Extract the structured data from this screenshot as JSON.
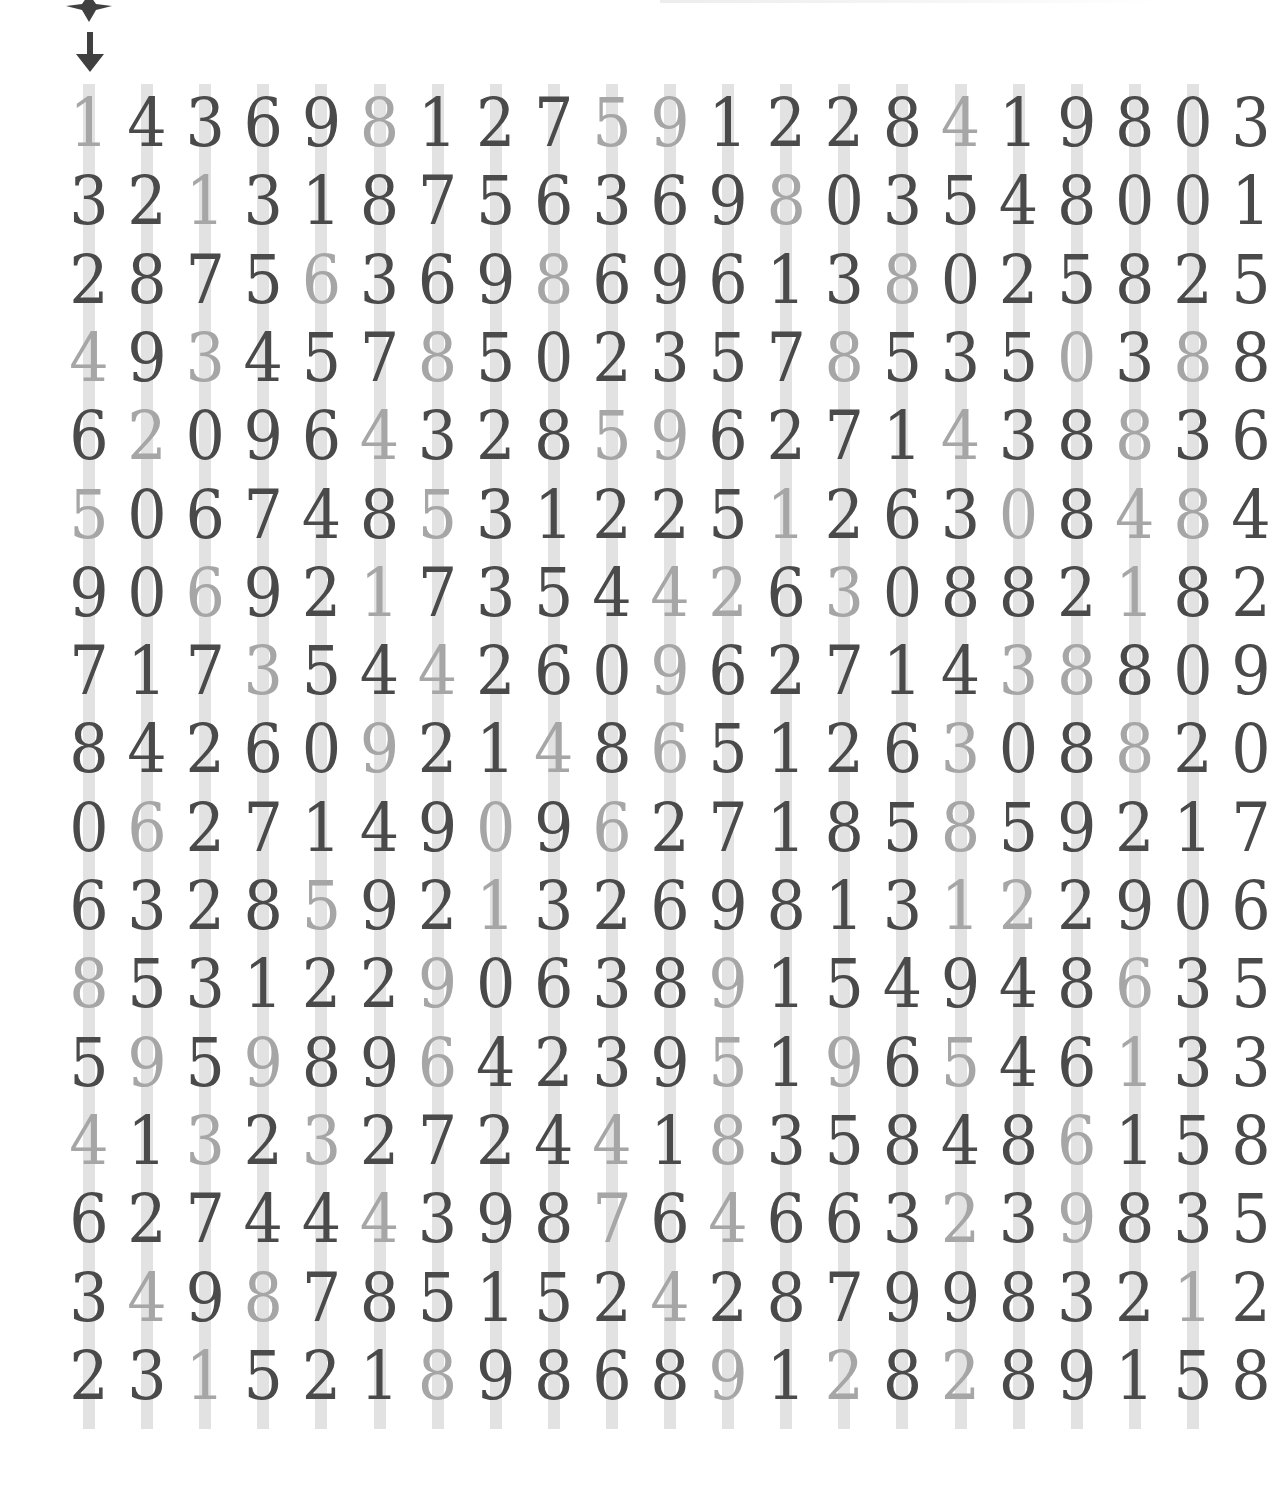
{
  "puzzle": {
    "type": "digit-grid",
    "columns": 20,
    "rows_count": 17,
    "colors": {
      "dark": "#4a4a4a",
      "light": "#a6a6a6",
      "column_bar": "#e2e2e2",
      "icon": "#404040"
    },
    "markers": {
      "top_icon": "star-shape-icon",
      "arrow": "down-arrow-icon"
    },
    "rows": [
      "14369812759122841980 3",
      "32131875636980354800 1",
      "28756369869613802582 5",
      "49345785023578535038 8",
      "62096432859627143883 6",
      "50674853122512630848 4",
      "90692173544263088218 2",
      "71735442609627143880 9",
      "84260921486512630882 0",
      "06271490962718585921 7",
      "63285921326981312290 6",
      "85312290638915494863 5",
      "59598964239519654613 3",
      "41323272441835848615 8",
      "62744439876466323983 5",
      "34987851524287998321 2",
      "23152189868912828915 8"
    ],
    "light_mask": [
      [
        0,
        5,
        9,
        10,
        15
      ],
      [
        2,
        12
      ],
      [
        4,
        8,
        14
      ],
      [
        0,
        2,
        6,
        13,
        17,
        19
      ],
      [
        1,
        5,
        9,
        10,
        15,
        18
      ],
      [
        0,
        6,
        12,
        16,
        18,
        19
      ],
      [
        2,
        5,
        10,
        11,
        13,
        18
      ],
      [
        3,
        6,
        10,
        16,
        17
      ],
      [
        5,
        8,
        10,
        15,
        18
      ],
      [
        1,
        7,
        9,
        15
      ],
      [
        4,
        7,
        15,
        16
      ],
      [
        0,
        6,
        11,
        18
      ],
      [
        1,
        3,
        6,
        11,
        13,
        15,
        18
      ],
      [
        0,
        2,
        4,
        9,
        11,
        17
      ],
      [
        5,
        9,
        11,
        15,
        17
      ],
      [
        1,
        3,
        10,
        19
      ],
      [
        2,
        6,
        11,
        13,
        15
      ]
    ]
  }
}
